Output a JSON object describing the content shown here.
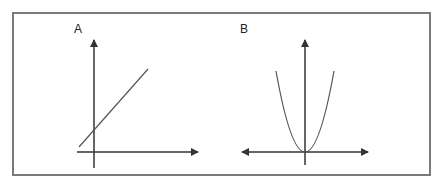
{
  "panels": [
    {
      "label": "A",
      "description": "Straight line with positive slope crossing the y-axis above origin",
      "curve": "linear"
    },
    {
      "label": "B",
      "description": "Upward-opening parabola with vertex at origin",
      "curve": "quadratic"
    }
  ],
  "colors": {
    "axis": "#333333",
    "curve": "#555555",
    "frame": "#7a7a7a"
  }
}
